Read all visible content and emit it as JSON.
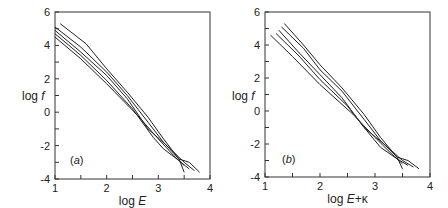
{
  "chart_data": [
    {
      "type": "line",
      "panel_label": "(a)",
      "xlabel": "log E",
      "ylabel": "log f",
      "xlim": [
        1,
        4
      ],
      "ylim": [
        -4,
        6
      ],
      "xticks": [
        "1",
        "2",
        "3",
        "4"
      ],
      "yticks": [
        "-4",
        "-2",
        "0",
        "2",
        "4",
        "6"
      ],
      "grid": false,
      "legend": null,
      "series": [
        {
          "name": "curve 1",
          "x": [
            1.1,
            1.6,
            2.0,
            2.4,
            2.8,
            3.1,
            3.4,
            3.6,
            3.8
          ],
          "y": [
            5.3,
            4.1,
            2.6,
            1.2,
            -0.3,
            -1.6,
            -2.8,
            -3.0,
            -3.6
          ]
        },
        {
          "name": "curve 2",
          "x": [
            1.0,
            1.5,
            2.0,
            2.4,
            2.8,
            3.1,
            3.4,
            3.5
          ],
          "y": [
            5.1,
            3.9,
            2.4,
            1.0,
            -0.6,
            -1.8,
            -2.8,
            -3.6
          ]
        },
        {
          "name": "curve 3",
          "x": [
            1.0,
            1.5,
            2.0,
            2.4,
            2.8,
            3.2,
            3.5,
            3.7
          ],
          "y": [
            4.9,
            3.6,
            2.2,
            0.8,
            -1.0,
            -2.1,
            -3.0,
            -3.5
          ]
        },
        {
          "name": "curve 4",
          "x": [
            1.0,
            1.5,
            2.0,
            2.5,
            2.9,
            3.1,
            3.4,
            3.6
          ],
          "y": [
            4.7,
            3.4,
            1.9,
            0.2,
            -1.5,
            -2.2,
            -2.9,
            -3.4
          ]
        },
        {
          "name": "curve 5",
          "x": [
            1.0,
            1.5,
            2.0,
            2.6,
            3.0,
            3.3,
            3.5
          ],
          "y": [
            4.5,
            3.2,
            1.7,
            -0.2,
            -1.6,
            -2.6,
            -3.2
          ]
        }
      ]
    },
    {
      "type": "line",
      "panel_label": "(b)",
      "xlabel": "log E+κ",
      "ylabel": "log f",
      "xlim": [
        1,
        4
      ],
      "ylim": [
        -4,
        6
      ],
      "xticks": [
        "1",
        "2",
        "3",
        "4"
      ],
      "yticks": [
        "-4",
        "-2",
        "0",
        "2",
        "4",
        "6"
      ],
      "grid": false,
      "legend": null,
      "series": [
        {
          "name": "curve 1",
          "x": [
            1.35,
            1.7,
            2.0,
            2.4,
            2.8,
            3.1,
            3.4,
            3.6,
            3.8
          ],
          "y": [
            5.3,
            4.0,
            2.8,
            1.4,
            -0.2,
            -1.6,
            -2.8,
            -3.0,
            -3.5
          ]
        },
        {
          "name": "curve 2",
          "x": [
            1.3,
            1.7,
            2.0,
            2.4,
            2.8,
            3.1,
            3.4,
            3.5
          ],
          "y": [
            5.1,
            3.8,
            2.5,
            1.2,
            -0.5,
            -1.8,
            -2.8,
            -3.5
          ]
        },
        {
          "name": "curve 3",
          "x": [
            1.25,
            1.6,
            2.0,
            2.4,
            2.8,
            3.2,
            3.5,
            3.7
          ],
          "y": [
            4.9,
            3.6,
            2.2,
            0.8,
            -1.0,
            -2.1,
            -3.0,
            -3.4
          ]
        },
        {
          "name": "curve 4",
          "x": [
            1.2,
            1.6,
            2.0,
            2.5,
            2.9,
            3.1,
            3.4,
            3.6
          ],
          "y": [
            4.7,
            3.4,
            1.9,
            0.3,
            -1.4,
            -2.2,
            -2.9,
            -3.3
          ]
        },
        {
          "name": "curve 5",
          "x": [
            1.1,
            1.5,
            2.0,
            2.6,
            3.0,
            3.3,
            3.5
          ],
          "y": [
            4.6,
            3.3,
            1.6,
            -0.2,
            -1.6,
            -2.6,
            -3.2
          ]
        }
      ]
    }
  ],
  "panels": [
    {
      "label": "(a)",
      "xlabel": "log E",
      "ylabel": "log f"
    },
    {
      "label": "(b)",
      "xlabel": "log E+κ",
      "ylabel": "log f"
    }
  ]
}
